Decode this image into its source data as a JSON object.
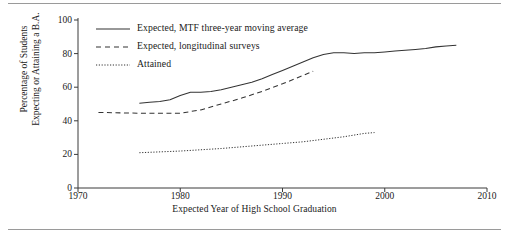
{
  "chart_data": {
    "type": "line",
    "title": "",
    "xlabel": "Expected Year of High School Graduation",
    "ylabel": "Percentage of Students Expecting or Attaining a B.A.",
    "ylabel_line1": "Percentage of Students",
    "ylabel_line2": "Expecting or Attaining a B.A.",
    "xlim": [
      1970,
      2010
    ],
    "ylim": [
      0,
      100
    ],
    "xticks": [
      1970,
      1980,
      1990,
      2000,
      2010
    ],
    "yticks": [
      0,
      20,
      40,
      60,
      80,
      100
    ],
    "xtick_labels": [
      "1970",
      "1980",
      "1990",
      "2000",
      "2010"
    ],
    "ytick_labels": [
      "0",
      "20",
      "40",
      "60",
      "80",
      "100"
    ],
    "grid": false,
    "legend_position": "top-left-inside",
    "series": [
      {
        "name": "Expected, MTF three-year moving average",
        "style": "solid",
        "color": "#333333",
        "x": [
          1976,
          1977,
          1978,
          1979,
          1980,
          1981,
          1982,
          1983,
          1984,
          1985,
          1986,
          1987,
          1988,
          1989,
          1990,
          1991,
          1992,
          1993,
          1994,
          1995,
          1996,
          1997,
          1998,
          1999,
          2000,
          2001,
          2002,
          2003,
          2004,
          2005,
          2006,
          2007
        ],
        "values": [
          50.5,
          51.0,
          51.5,
          52.5,
          55.0,
          57.0,
          57.0,
          57.5,
          58.5,
          60.0,
          61.5,
          63.0,
          65.0,
          67.5,
          70.0,
          72.5,
          75.0,
          77.5,
          79.5,
          80.5,
          80.5,
          80.0,
          80.5,
          80.5,
          81.0,
          81.5,
          82.0,
          82.5,
          83.0,
          84.0,
          84.5,
          85.0
        ]
      },
      {
        "name": "Expected, longitudinal surveys",
        "style": "dashed",
        "color": "#333333",
        "x": [
          1972,
          1976,
          1980,
          1982,
          1984,
          1986,
          1988,
          1990,
          1992,
          1993
        ],
        "values": [
          45.0,
          44.5,
          44.5,
          46.5,
          50.0,
          53.5,
          57.5,
          62.0,
          67.0,
          69.5
        ]
      },
      {
        "name": "Attained",
        "style": "dotted",
        "color": "#333333",
        "x": [
          1976,
          1980,
          1984,
          1988,
          1990,
          1992,
          1994,
          1996,
          1998,
          1999
        ],
        "values": [
          21.0,
          22.0,
          23.5,
          25.5,
          26.5,
          27.5,
          29.0,
          30.5,
          32.5,
          33.0
        ]
      }
    ],
    "legend": [
      {
        "label": "Expected, MTF three-year moving average",
        "style": "solid"
      },
      {
        "label": "Expected, longitudinal surveys",
        "style": "dashed"
      },
      {
        "label": "Attained",
        "style": "dotted"
      }
    ]
  }
}
